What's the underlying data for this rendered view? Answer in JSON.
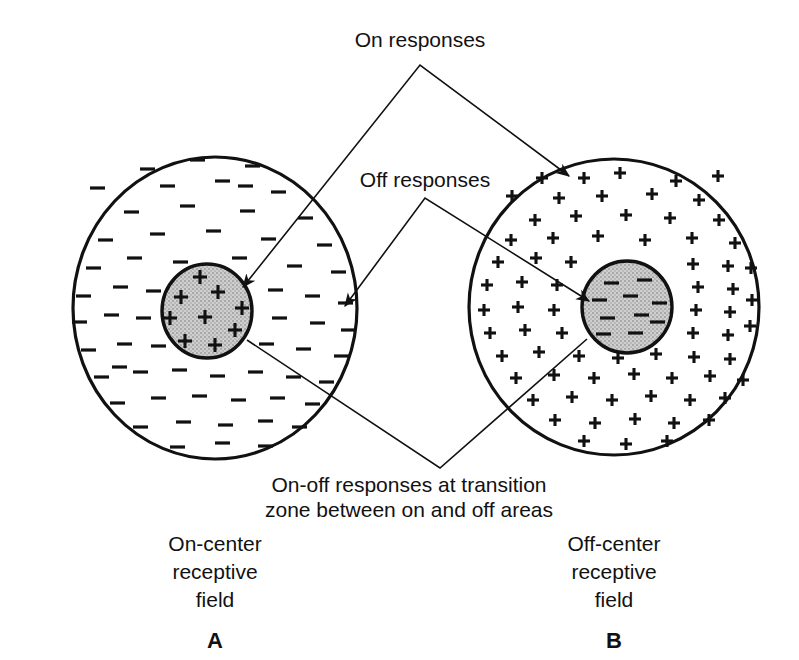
{
  "figure": {
    "background_color": "#ffffff",
    "ink_color": "#111111",
    "center_fill_color": "#c9c9c9",
    "surround_fill_color": "#ffffff"
  },
  "callouts": {
    "on_responses": "On responses",
    "off_responses": "Off responses",
    "on_off_line1": "On-off responses at transition",
    "on_off_line2": "zone between on and off areas"
  },
  "panels": [
    {
      "key": "A",
      "panel_letter": "A",
      "caption_line1": "On-center",
      "caption_line2": "receptive",
      "caption_line3": "field",
      "center_sign": "+",
      "surround_sign": "−",
      "center_symbol_name": "plus",
      "surround_symbol_name": "minus",
      "field_center_x": 215,
      "field_center_y": 308,
      "field_radius_x": 142,
      "field_radius_y": 151,
      "center_circle_x": 207,
      "center_circle_y": 311,
      "center_radius_x": 45,
      "center_radius_y": 47,
      "center_symbol_count": 9,
      "surround_symbol_count": 62
    },
    {
      "key": "B",
      "panel_letter": "B",
      "caption_line1": "Off-center",
      "caption_line2": "receptive",
      "caption_line3": "field",
      "center_sign": "−",
      "surround_sign": "+",
      "center_symbol_name": "minus",
      "surround_symbol_name": "plus",
      "field_center_x": 614,
      "field_center_y": 307,
      "field_radius_x": 145,
      "field_radius_y": 148,
      "center_circle_x": 627,
      "center_circle_y": 307,
      "center_radius_x": 45,
      "center_radius_y": 46,
      "center_symbol_count": 10,
      "surround_symbol_count": 74
    }
  ],
  "label_positions": {
    "on_responses_x": 420,
    "on_responses_y": 47,
    "off_responses_x": 425,
    "off_responses_y": 180,
    "on_off_x": 409,
    "on_off_line1_y": 485,
    "on_off_line2_y": 510,
    "panel_a_caption_x": 215,
    "panel_a_caption_y": 540,
    "panel_b_caption_x": 614,
    "panel_b_caption_y": 540,
    "panel_a_letter_y": 630,
    "panel_b_letter_y": 630
  },
  "arrow_targets": [
    {
      "name": "on-responses-to-a-center",
      "x": 243,
      "y": 287
    },
    {
      "name": "on-responses-to-b-surround",
      "x": 569,
      "y": 176
    },
    {
      "name": "off-responses-to-a-surround",
      "x": 345,
      "y": 306
    },
    {
      "name": "off-responses-to-b-center",
      "x": 589,
      "y": 301
    },
    {
      "name": "on-off-to-a-center-edge",
      "x": 247,
      "y": 340
    },
    {
      "name": "on-off-to-b-center-edge",
      "x": 587,
      "y": 339
    }
  ]
}
